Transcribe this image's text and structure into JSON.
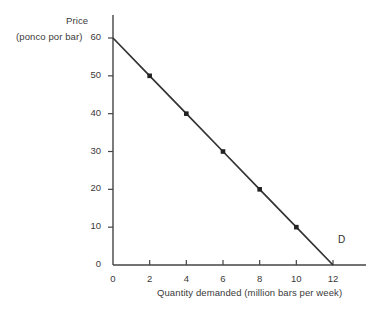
{
  "chart_data": {
    "type": "line",
    "title": "",
    "subtitle": "",
    "xlabel": "Quantity demanded (million bars per week)",
    "ylabel_line1": "Price",
    "ylabel_line2": "(ponco por bar)",
    "xlim": [
      0,
      12
    ],
    "ylim": [
      0,
      60
    ],
    "xticks": [
      "0",
      "2",
      "4",
      "6",
      "8",
      "10",
      "12"
    ],
    "xtick_values": [
      0,
      2,
      4,
      6,
      8,
      10,
      12
    ],
    "yticks": [
      "0",
      "10",
      "20",
      "30",
      "40",
      "50",
      "60"
    ],
    "ytick_values": [
      0,
      10,
      20,
      30,
      40,
      50,
      60
    ],
    "grid": false,
    "legend": "none",
    "series": [
      {
        "name": "D",
        "label": "D",
        "color": "#333333",
        "marker": "square",
        "x": [
          0,
          2,
          4,
          6,
          8,
          10,
          12
        ],
        "y": [
          60,
          50,
          40,
          30,
          20,
          10,
          0
        ],
        "marker_x": [
          2,
          4,
          6,
          8,
          10
        ],
        "marker_y": [
          50,
          40,
          30,
          20,
          10
        ]
      }
    ],
    "annotations": [
      {
        "text": "D",
        "x": 12,
        "y": 4,
        "name": "demand-curve-label"
      }
    ]
  },
  "colors": {
    "background": "#ffffff",
    "axis": "#444444",
    "curve": "#333333",
    "text": "#3a3a3a",
    "marker": "#222222"
  }
}
